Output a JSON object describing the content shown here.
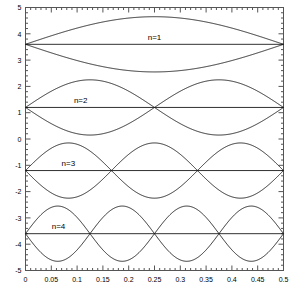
{
  "chart_data": {
    "type": "line",
    "title": "",
    "xlabel": "",
    "ylabel": "",
    "xlim": [
      0,
      0.5
    ],
    "ylim": [
      -5,
      5
    ],
    "grid": false,
    "legend_position": "inline-annotation",
    "x_ticks": [
      0,
      0.05,
      0.1,
      0.15,
      0.2,
      0.25,
      0.3,
      0.35,
      0.4,
      0.45,
      0.5
    ],
    "x_tick_labels": [
      "0",
      "0.05",
      "0.1",
      "0.15",
      "0.2",
      "0.25",
      "0.3",
      "0.35",
      "0.4",
      "0.45",
      "0.5"
    ],
    "x_minor_tick_step": 0.01,
    "y_ticks": [
      -5,
      -4,
      -3,
      -2,
      -1,
      0,
      1,
      2,
      3,
      4,
      5
    ],
    "y_tick_labels": [
      "-5",
      "-4",
      "-3",
      "-2",
      "-1",
      "0",
      "1",
      "2",
      "3",
      "4",
      "5"
    ],
    "y_minor_tick_step": 0.2,
    "annotations": [
      {
        "text": "n=1",
        "x": 0.25,
        "y": 3.82
      },
      {
        "text": "n=2",
        "x": 0.107,
        "y": 1.42
      },
      {
        "text": "n=3",
        "x": 0.083,
        "y": -0.98
      },
      {
        "text": "n=4",
        "x": 0.064,
        "y": -3.38
      }
    ],
    "series": [
      {
        "name": "n=1 baseline",
        "kind": "baseline",
        "mode": 1,
        "offset": 3.6,
        "amplitude": 0,
        "nodes": [
          0,
          0.5
        ]
      },
      {
        "name": "n=1 envelope upper",
        "kind": "envelope",
        "mode": 1,
        "offset": 3.6,
        "amplitude": 1.05,
        "sign": 1,
        "peaks": [
          {
            "x": 0.25,
            "y": 4.65
          }
        ]
      },
      {
        "name": "n=1 envelope lower",
        "kind": "envelope",
        "mode": 1,
        "offset": 3.6,
        "amplitude": 1.05,
        "sign": -1,
        "peaks": [
          {
            "x": 0.25,
            "y": 2.55
          }
        ]
      },
      {
        "name": "n=2 baseline",
        "kind": "baseline",
        "mode": 2,
        "offset": 1.2,
        "amplitude": 0,
        "nodes": [
          0,
          0.25,
          0.5
        ]
      },
      {
        "name": "n=2 envelope upper",
        "kind": "envelope",
        "mode": 2,
        "offset": 1.2,
        "amplitude": 1.05,
        "sign": 1,
        "peaks": [
          {
            "x": 0.125,
            "y": 2.25
          },
          {
            "x": 0.375,
            "y": 2.25
          }
        ]
      },
      {
        "name": "n=2 envelope lower",
        "kind": "envelope",
        "mode": 2,
        "offset": 1.2,
        "amplitude": 1.05,
        "sign": -1,
        "peaks": [
          {
            "x": 0.125,
            "y": 0.15
          },
          {
            "x": 0.375,
            "y": 0.15
          }
        ]
      },
      {
        "name": "n=3 baseline",
        "kind": "baseline",
        "mode": 3,
        "offset": -1.2,
        "amplitude": 0,
        "nodes": [
          0,
          0.1667,
          0.3333,
          0.5
        ]
      },
      {
        "name": "n=3 envelope upper",
        "kind": "envelope",
        "mode": 3,
        "offset": -1.2,
        "amplitude": 1.05,
        "sign": 1,
        "peaks": [
          {
            "x": 0.0833,
            "y": -0.15
          },
          {
            "x": 0.25,
            "y": -0.15
          },
          {
            "x": 0.4167,
            "y": -0.15
          }
        ]
      },
      {
        "name": "n=3 envelope lower",
        "kind": "envelope",
        "mode": 3,
        "offset": -1.2,
        "amplitude": 1.05,
        "sign": -1,
        "peaks": [
          {
            "x": 0.0833,
            "y": -2.25
          },
          {
            "x": 0.25,
            "y": -2.25
          },
          {
            "x": 0.4167,
            "y": -2.25
          }
        ]
      },
      {
        "name": "n=4 baseline",
        "kind": "baseline",
        "mode": 4,
        "offset": -3.6,
        "amplitude": 0,
        "nodes": [
          0,
          0.125,
          0.25,
          0.375,
          0.5
        ]
      },
      {
        "name": "n=4 envelope upper",
        "kind": "envelope",
        "mode": 4,
        "offset": -3.6,
        "amplitude": 1.05,
        "sign": 1,
        "peaks": [
          {
            "x": 0.0625,
            "y": -2.55
          },
          {
            "x": 0.1875,
            "y": -2.55
          },
          {
            "x": 0.3125,
            "y": -2.55
          },
          {
            "x": 0.4375,
            "y": -2.55
          }
        ]
      },
      {
        "name": "n=4 envelope lower",
        "kind": "envelope",
        "mode": 4,
        "offset": -3.6,
        "amplitude": 1.05,
        "sign": -1,
        "peaks": [
          {
            "x": 0.0625,
            "y": -4.65
          },
          {
            "x": 0.1875,
            "y": -4.65
          },
          {
            "x": 0.3125,
            "y": -4.65
          },
          {
            "x": 0.4375,
            "y": -4.65
          }
        ]
      }
    ],
    "colors": {
      "curve": "#1a1a1a",
      "axis": "#555555",
      "background": "#ffffff",
      "text": "#000000"
    }
  }
}
